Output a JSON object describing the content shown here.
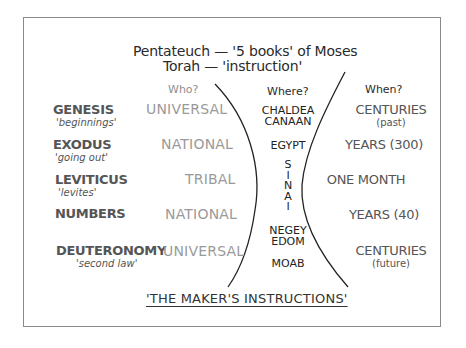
{
  "header": {
    "line1": "Pentateuch — '5 books' of Moses",
    "line2": "Torah — 'instruction'"
  },
  "columns": {
    "who": "Who?",
    "where": "Where?",
    "when": "When?"
  },
  "books": [
    {
      "name": "GENESIS",
      "meaning": "'beginnings'",
      "who": "UNIVERSAL",
      "when": "CENTURIES",
      "when_sub": "(past)"
    },
    {
      "name": "EXODUS",
      "meaning": "'going out'",
      "who": "NATIONAL",
      "when": "YEARS (300)",
      "when_sub": ""
    },
    {
      "name": "LEVITICUS",
      "meaning": "'levites'",
      "who": "TRIBAL",
      "when": "ONE MONTH",
      "when_sub": ""
    },
    {
      "name": "NUMBERS",
      "meaning": "",
      "who": "NATIONAL",
      "when": "YEARS (40)",
      "when_sub": ""
    },
    {
      "name": "DEUTERONOMY",
      "meaning": "'second law'",
      "who": "UNIVERSAL",
      "when": "CENTURIES",
      "when_sub": "(future)"
    }
  ],
  "places": {
    "chaldea": "CHALDEA",
    "canaan": "CANAAN",
    "egypt": "EGYPT",
    "sinai": [
      "S",
      "I",
      "N",
      "A",
      "I"
    ],
    "negev": "NEGEY",
    "edom": "EDOM",
    "moab": "MOAB"
  },
  "footer": "'THE MAKER'S INSTRUCTIONS'",
  "colors": {
    "frame": "#8a8a8a",
    "light_text": "#9a9a9a",
    "mid_text": "#555555",
    "dark_text": "#222222"
  }
}
